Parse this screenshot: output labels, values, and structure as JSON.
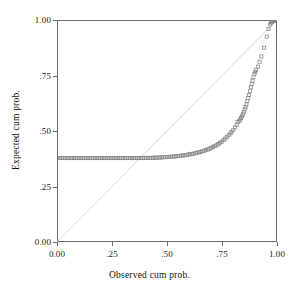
{
  "chart_data": {
    "type": "scatter",
    "title": "",
    "subtitle": "",
    "xlabel": "Observed cum prob.",
    "ylabel": "Expected cum prob.",
    "xlim": [
      0.0,
      1.0
    ],
    "ylim": [
      0.0,
      1.0
    ],
    "xticks": [
      0.0,
      0.25,
      0.5,
      0.75,
      1.0
    ],
    "yticks": [
      0.0,
      0.25,
      0.5,
      0.75,
      1.0
    ],
    "xtick_labels": [
      "0.00",
      ".25",
      ".50",
      ".75",
      "1.00"
    ],
    "ytick_labels": [
      "0.00",
      ".25",
      ".50",
      ".75",
      "1.00"
    ],
    "grid": false,
    "legend": "none",
    "marker": "open-square",
    "marker_color": "#8a8a8a",
    "reference_line": {
      "label": "diagonal identity line",
      "from": [
        0.0,
        0.0
      ],
      "to": [
        1.0,
        1.0
      ],
      "color": "#d8d8d8"
    },
    "series": [
      {
        "name": "Normal P-P plot points",
        "points": [
          [
            0.005,
            0.378
          ],
          [
            0.013,
            0.378
          ],
          [
            0.021,
            0.378
          ],
          [
            0.029,
            0.378
          ],
          [
            0.037,
            0.378
          ],
          [
            0.045,
            0.378
          ],
          [
            0.053,
            0.378
          ],
          [
            0.061,
            0.378
          ],
          [
            0.069,
            0.378
          ],
          [
            0.077,
            0.378
          ],
          [
            0.085,
            0.378
          ],
          [
            0.093,
            0.378
          ],
          [
            0.101,
            0.378
          ],
          [
            0.109,
            0.378
          ],
          [
            0.117,
            0.378
          ],
          [
            0.125,
            0.378
          ],
          [
            0.133,
            0.378
          ],
          [
            0.141,
            0.378
          ],
          [
            0.149,
            0.378
          ],
          [
            0.157,
            0.378
          ],
          [
            0.165,
            0.378
          ],
          [
            0.173,
            0.378
          ],
          [
            0.181,
            0.378
          ],
          [
            0.189,
            0.378
          ],
          [
            0.197,
            0.378
          ],
          [
            0.205,
            0.378
          ],
          [
            0.213,
            0.378
          ],
          [
            0.221,
            0.378
          ],
          [
            0.229,
            0.378
          ],
          [
            0.237,
            0.378
          ],
          [
            0.245,
            0.378
          ],
          [
            0.253,
            0.378
          ],
          [
            0.261,
            0.378
          ],
          [
            0.269,
            0.378
          ],
          [
            0.277,
            0.378
          ],
          [
            0.285,
            0.378
          ],
          [
            0.293,
            0.378
          ],
          [
            0.301,
            0.378
          ],
          [
            0.309,
            0.378
          ],
          [
            0.317,
            0.378
          ],
          [
            0.325,
            0.378
          ],
          [
            0.333,
            0.378
          ],
          [
            0.341,
            0.378
          ],
          [
            0.349,
            0.378
          ],
          [
            0.357,
            0.378
          ],
          [
            0.365,
            0.378
          ],
          [
            0.373,
            0.378
          ],
          [
            0.381,
            0.378
          ],
          [
            0.389,
            0.378
          ],
          [
            0.397,
            0.378
          ],
          [
            0.405,
            0.379
          ],
          [
            0.413,
            0.379
          ],
          [
            0.421,
            0.379
          ],
          [
            0.429,
            0.379
          ],
          [
            0.437,
            0.379
          ],
          [
            0.445,
            0.38
          ],
          [
            0.453,
            0.38
          ],
          [
            0.461,
            0.38
          ],
          [
            0.469,
            0.381
          ],
          [
            0.477,
            0.381
          ],
          [
            0.485,
            0.382
          ],
          [
            0.493,
            0.382
          ],
          [
            0.501,
            0.383
          ],
          [
            0.509,
            0.383
          ],
          [
            0.517,
            0.384
          ],
          [
            0.525,
            0.385
          ],
          [
            0.533,
            0.385
          ],
          [
            0.541,
            0.386
          ],
          [
            0.549,
            0.387
          ],
          [
            0.557,
            0.388
          ],
          [
            0.565,
            0.389
          ],
          [
            0.573,
            0.39
          ],
          [
            0.581,
            0.391
          ],
          [
            0.589,
            0.392
          ],
          [
            0.597,
            0.394
          ],
          [
            0.605,
            0.395
          ],
          [
            0.613,
            0.397
          ],
          [
            0.621,
            0.398
          ],
          [
            0.629,
            0.4
          ],
          [
            0.637,
            0.402
          ],
          [
            0.645,
            0.404
          ],
          [
            0.653,
            0.406
          ],
          [
            0.661,
            0.409
          ],
          [
            0.669,
            0.411
          ],
          [
            0.677,
            0.414
          ],
          [
            0.685,
            0.417
          ],
          [
            0.693,
            0.42
          ],
          [
            0.701,
            0.424
          ],
          [
            0.709,
            0.428
          ],
          [
            0.717,
            0.432
          ],
          [
            0.725,
            0.436
          ],
          [
            0.733,
            0.441
          ],
          [
            0.741,
            0.447
          ],
          [
            0.749,
            0.452
          ],
          [
            0.757,
            0.459
          ],
          [
            0.765,
            0.466
          ],
          [
            0.773,
            0.474
          ],
          [
            0.781,
            0.482
          ],
          [
            0.789,
            0.489
          ],
          [
            0.793,
            0.496
          ],
          [
            0.801,
            0.505
          ],
          [
            0.809,
            0.516
          ],
          [
            0.817,
            0.528
          ],
          [
            0.821,
            0.54
          ],
          [
            0.829,
            0.546
          ],
          [
            0.833,
            0.552
          ],
          [
            0.837,
            0.558
          ],
          [
            0.841,
            0.566
          ],
          [
            0.845,
            0.575
          ],
          [
            0.849,
            0.585
          ],
          [
            0.853,
            0.597
          ],
          [
            0.857,
            0.607
          ],
          [
            0.861,
            0.62
          ],
          [
            0.865,
            0.634
          ],
          [
            0.869,
            0.648
          ],
          [
            0.873,
            0.662
          ],
          [
            0.877,
            0.679
          ],
          [
            0.881,
            0.697
          ],
          [
            0.885,
            0.711
          ],
          [
            0.889,
            0.727
          ],
          [
            0.893,
            0.742
          ],
          [
            0.897,
            0.757
          ],
          [
            0.901,
            0.766
          ],
          [
            0.905,
            0.775
          ],
          [
            0.913,
            0.79
          ],
          [
            0.921,
            0.812
          ],
          [
            0.929,
            0.836
          ],
          [
            0.941,
            0.875
          ],
          [
            0.953,
            0.925
          ],
          [
            0.961,
            0.96
          ],
          [
            0.969,
            0.98
          ],
          [
            0.973,
            0.988
          ],
          [
            0.977,
            0.992
          ],
          [
            0.981,
            0.994
          ],
          [
            0.985,
            0.996
          ],
          [
            0.989,
            0.997
          ],
          [
            0.993,
            0.998
          ],
          [
            0.995,
            0.999
          ],
          [
            0.997,
            0.999
          ],
          [
            0.999,
            1.0
          ]
        ]
      }
    ]
  }
}
